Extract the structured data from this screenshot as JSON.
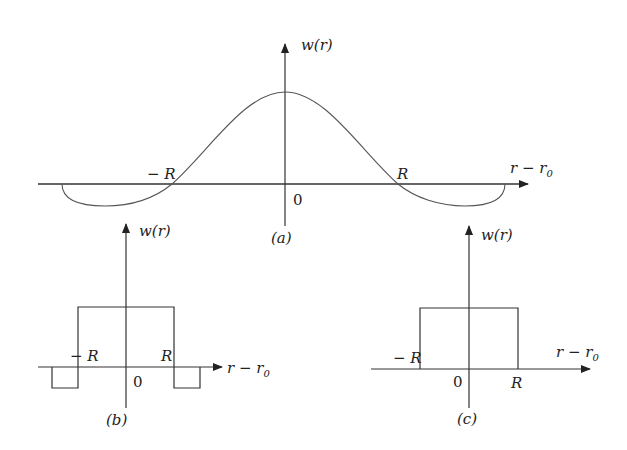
{
  "figure": {
    "panels": [
      {
        "id": "a",
        "caption": "(a)",
        "y_label": "w(r)",
        "x_label_main": "r − r",
        "x_label_sub": "0",
        "origin_label": "0",
        "neg_tick": "− R",
        "pos_tick": "R",
        "shape": "mexican-hat (smooth curve with negative side lobes)"
      },
      {
        "id": "b",
        "caption": "(b)",
        "y_label": "w(r)",
        "x_label_main": "r − r",
        "x_label_sub": "0",
        "origin_label": "0",
        "neg_tick": "− R",
        "pos_tick": "R",
        "shape": "rectangular pulse with negative rectangular side lobes"
      },
      {
        "id": "c",
        "caption": "(c)",
        "y_label": "w(r)",
        "x_label_main": "r − r",
        "x_label_sub": "0",
        "origin_label": "0",
        "neg_tick": "− R",
        "pos_tick": "R",
        "shape": "rectangular pulse"
      }
    ],
    "colors": {
      "stroke": "#333333",
      "curve": "#555555"
    }
  }
}
